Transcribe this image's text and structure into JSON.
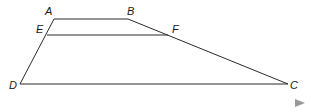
{
  "figure": {
    "type": "trapezoid",
    "points": {
      "A": {
        "label": "A",
        "x": 54,
        "y": 19
      },
      "B": {
        "label": "B",
        "x": 128,
        "y": 19
      },
      "C": {
        "label": "C",
        "x": 288,
        "y": 84
      },
      "D": {
        "label": "D",
        "x": 20,
        "y": 84
      },
      "E": {
        "label": "E",
        "x": 47,
        "y": 35
      },
      "F": {
        "label": "F",
        "x": 168,
        "y": 35
      }
    },
    "segments": [
      "AB",
      "BC",
      "CD",
      "DA",
      "EF"
    ],
    "colors": {
      "line": "#2a2a2a",
      "marker": "#999999"
    }
  }
}
